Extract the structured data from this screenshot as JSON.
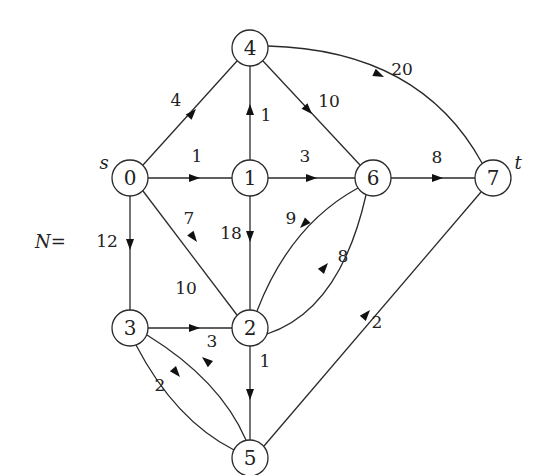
{
  "diagram": {
    "network_label": "N=",
    "source_label": "s",
    "sink_label": "t",
    "nodes": [
      {
        "id": "0",
        "label": "0",
        "x": 130,
        "y": 178
      },
      {
        "id": "1",
        "label": "1",
        "x": 250,
        "y": 178
      },
      {
        "id": "2",
        "label": "2",
        "x": 250,
        "y": 328
      },
      {
        "id": "3",
        "label": "3",
        "x": 130,
        "y": 328
      },
      {
        "id": "4",
        "label": "4",
        "x": 250,
        "y": 48
      },
      {
        "id": "5",
        "label": "5",
        "x": 250,
        "y": 458
      },
      {
        "id": "6",
        "label": "6",
        "x": 373,
        "y": 178
      },
      {
        "id": "7",
        "label": "7",
        "x": 493,
        "y": 178
      }
    ],
    "edges": [
      {
        "from": "0",
        "to": "4",
        "capacity": "4"
      },
      {
        "from": "0",
        "to": "1",
        "capacity": "1"
      },
      {
        "from": "0",
        "to": "2",
        "capacity": "7"
      },
      {
        "from": "0",
        "to": "3",
        "capacity": "12"
      },
      {
        "from": "1",
        "to": "4",
        "capacity": "1"
      },
      {
        "from": "1",
        "to": "6",
        "capacity": "3"
      },
      {
        "from": "1",
        "to": "2",
        "capacity": "18"
      },
      {
        "from": "4",
        "to": "6",
        "capacity": "10"
      },
      {
        "from": "4",
        "to": "7",
        "capacity": "20"
      },
      {
        "from": "6",
        "to": "7",
        "capacity": "8"
      },
      {
        "from": "6",
        "to": "2",
        "capacity": "9"
      },
      {
        "from": "2",
        "to": "6",
        "capacity": "8"
      },
      {
        "from": "3",
        "to": "2",
        "capacity": "10"
      },
      {
        "from": "2",
        "to": "5",
        "capacity": "1"
      },
      {
        "from": "5",
        "to": "3",
        "capacity": "3"
      },
      {
        "from": "3",
        "to": "5",
        "capacity": "2"
      },
      {
        "from": "5",
        "to": "7",
        "capacity": "2"
      }
    ]
  }
}
